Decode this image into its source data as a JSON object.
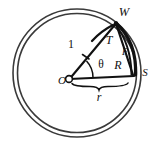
{
  "figure": {
    "type": "geometry-diagram",
    "background_color": "#ffffff",
    "ink_color": "#111111",
    "outline_color": "#3a3a3a"
  },
  "labels": {
    "center_point": "O",
    "top_point": "W",
    "right_point": "S",
    "chord_label": "T",
    "radius_label": "R",
    "arc_label": "F",
    "angle_label": "θ",
    "side_label": "1",
    "base_label": "r"
  },
  "geometry": {
    "circle_center_x": 77,
    "circle_center_y": 73,
    "circle_outer_radius": 64,
    "circle_inner_radius": 60,
    "vertex_o_x": 69,
    "vertex_o_y": 79,
    "point_w_x": 117,
    "point_w_y": 22,
    "point_s_x": 134,
    "point_s_y": 73
  }
}
